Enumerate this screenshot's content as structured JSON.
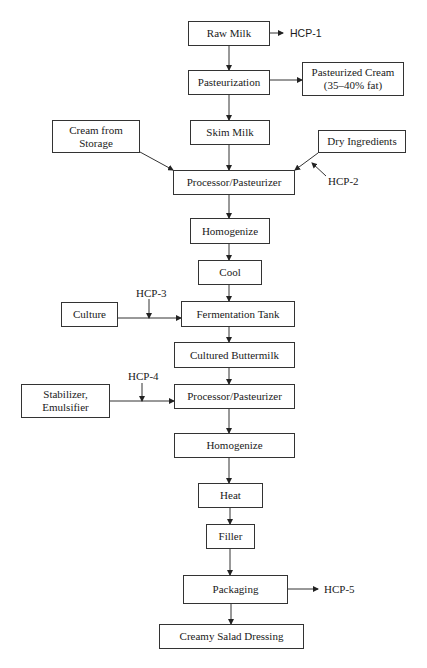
{
  "diagram": {
    "type": "process-flowchart",
    "nodes": {
      "raw_milk": "Raw Milk",
      "pasteurization": "Pasteurization",
      "pasteurized_cream": "Pasteurized Cream (35–40% fat)",
      "pasteurized_cream_line1": "Pasteurized Cream",
      "pasteurized_cream_line2": "(35–40% fat)",
      "skim_milk": "Skim Milk",
      "cream_from_storage_line1": "Cream from",
      "cream_from_storage_line2": "Storage",
      "dry_ingredients": "Dry Ingredients",
      "processor_pasteurizer_1": "Processor/Pasteurizer",
      "homogenize_1": "Homogenize",
      "cool": "Cool",
      "culture": "Culture",
      "fermentation_tank": "Fermentation Tank",
      "cultured_buttermilk": "Cultured Buttermilk",
      "stabilizer_line1": "Stabilizer,",
      "stabilizer_line2": "Emulsifier",
      "processor_pasteurizer_2": "Processor/Pasteurizer",
      "homogenize_2": "Homogenize",
      "heat": "Heat",
      "filler": "Filler",
      "packaging": "Packaging",
      "creamy_salad_dressing": "Creamy Salad Dressing"
    },
    "hazard_control_points": {
      "hcp1": "HCP-1",
      "hcp2": "HCP-2",
      "hcp3": "HCP-3",
      "hcp4": "HCP-4",
      "hcp5": "HCP-5"
    },
    "edges": [
      [
        "Raw Milk",
        "HCP-1"
      ],
      [
        "Raw Milk",
        "Pasteurization"
      ],
      [
        "Pasteurization",
        "Pasteurized Cream (35–40% fat)"
      ],
      [
        "Pasteurization",
        "Skim Milk"
      ],
      [
        "Skim Milk",
        "Processor/Pasteurizer"
      ],
      [
        "Cream from Storage",
        "Processor/Pasteurizer"
      ],
      [
        "Dry Ingredients",
        "Processor/Pasteurizer"
      ],
      [
        "HCP-2",
        "Dry Ingredients → Processor/Pasteurizer"
      ],
      [
        "Processor/Pasteurizer",
        "Homogenize"
      ],
      [
        "Homogenize",
        "Cool"
      ],
      [
        "Cool",
        "Fermentation Tank"
      ],
      [
        "Culture",
        "Fermentation Tank"
      ],
      [
        "HCP-3",
        "Culture → Fermentation Tank"
      ],
      [
        "Fermentation Tank",
        "Cultured Buttermilk"
      ],
      [
        "Cultured Buttermilk",
        "Processor/Pasteurizer"
      ],
      [
        "Stabilizer, Emulsifier",
        "Processor/Pasteurizer"
      ],
      [
        "HCP-4",
        "Stabilizer → Processor/Pasteurizer"
      ],
      [
        "Processor/Pasteurizer",
        "Homogenize"
      ],
      [
        "Homogenize",
        "Heat"
      ],
      [
        "Heat",
        "Filler"
      ],
      [
        "Filler",
        "Packaging"
      ],
      [
        "Packaging",
        "HCP-5"
      ],
      [
        "Packaging",
        "Creamy Salad Dressing"
      ]
    ]
  }
}
